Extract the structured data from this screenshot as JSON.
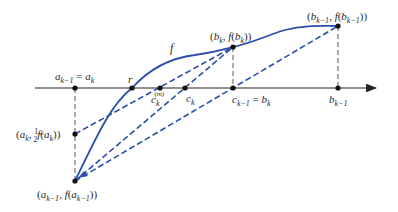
{
  "diagram": {
    "colors": {
      "curve": "#2a4fa8",
      "secant": "#2a4fa8",
      "axis": "#222222",
      "guide": "#444444",
      "point": "#111111"
    },
    "curve_label": "f",
    "points": {
      "a_km1_eq_ak": {
        "x": 75,
        "y": 88,
        "label": "a",
        "sub": "k−1",
        "rest": " = a",
        "rest_sub": "k"
      },
      "r": {
        "x": 132,
        "y": 88,
        "label": "r"
      },
      "ck_m": {
        "x": 160,
        "y": 88,
        "label": "c",
        "sub": "k",
        "sup": "(m)"
      },
      "ck": {
        "x": 185,
        "y": 88,
        "label": "c",
        "sub": "k"
      },
      "ckm1_eq_bk": {
        "x": 233,
        "y": 88,
        "label": "c",
        "sub": "k−1",
        "rest": " = b",
        "rest_sub": "k"
      },
      "bkm1": {
        "x": 338,
        "y": 88,
        "label": "b",
        "sub": "k−1"
      },
      "bk_fbk": {
        "x": 233,
        "y": 47,
        "label": "(b_k, f(b_k))"
      },
      "bkm1_fbkm1": {
        "x": 338,
        "y": 26,
        "label": "(b_{k−1}, f(b_{k−1}))"
      },
      "ak_half_fak": {
        "x": 75,
        "y": 134,
        "label": "(a_k, ½f(a_k))"
      },
      "akm1_fakm1": {
        "x": 75,
        "y": 181,
        "label": "(a_{k−1}, f(a_{k−1}))"
      }
    }
  }
}
